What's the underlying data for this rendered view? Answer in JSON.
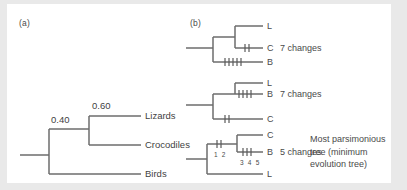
{
  "figure": {
    "background_color": "#e9e9e9",
    "canvas_color": "#ffffff",
    "line_color": "#6d6d6d",
    "text_color": "#4a4a4a"
  },
  "panel_a": {
    "label": "(a)",
    "branch_lengths": [
      {
        "value": "0.40"
      },
      {
        "value": "0.60"
      }
    ],
    "taxa": [
      {
        "name": "Lizards"
      },
      {
        "name": "Crocodiles"
      },
      {
        "name": "Birds"
      }
    ]
  },
  "panel_b": {
    "label": "(b)",
    "trees": [
      {
        "tips": [
          "L",
          "C",
          "B"
        ],
        "changes_label": "7 changes",
        "ticks": {
          "C": 2,
          "B": 5
        }
      },
      {
        "tips": [
          "L",
          "B",
          "C"
        ],
        "changes_label": "7 changes",
        "ticks": {
          "B": 4,
          "C": 2
        }
      },
      {
        "tips": [
          "C",
          "B",
          "L"
        ],
        "changes_label": "5 changes",
        "ticks": {
          "upper": 2,
          "lower": 3
        },
        "tick_numbers": {
          "upper": "1 2",
          "lower": "3 4 5"
        }
      }
    ],
    "note_lines": [
      "Most parsimonious",
      "tree (minimum",
      "evolution tree)"
    ]
  }
}
